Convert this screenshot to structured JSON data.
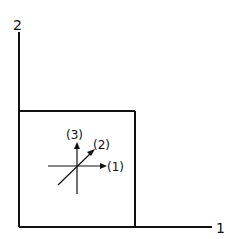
{
  "diagram": {
    "axes": {
      "vertical_label": "2",
      "horizontal_label": "1"
    },
    "box": {
      "description": "square region in lower-left quadrant"
    },
    "local_axes": {
      "axis_1_label": "(1)",
      "axis_2_label": "(2)",
      "axis_3_label": "(3)"
    },
    "colors": {
      "line": "#111111",
      "background": "#ffffff"
    }
  }
}
